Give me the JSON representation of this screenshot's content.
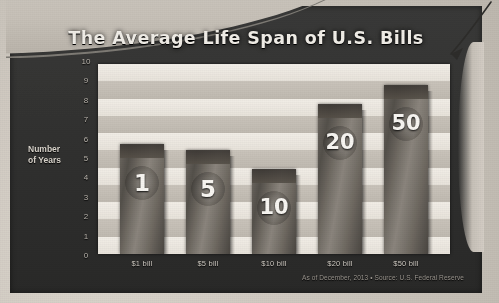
{
  "chart_data": {
    "type": "bar",
    "title": "The Average Life Span of U.S. Bills",
    "xlabel": "",
    "ylabel": "Number of Years",
    "ylim": [
      0,
      10
    ],
    "yticks": [
      "10",
      "9",
      "8",
      "7",
      "6",
      "5",
      "4",
      "3",
      "2",
      "1",
      "0"
    ],
    "grid": false,
    "legend": null,
    "categories": [
      "$1 bill",
      "$5 bill",
      "$10 bill",
      "$20 bill",
      "$50 bill"
    ],
    "values": [
      5.8,
      5.5,
      4.5,
      7.9,
      8.9
    ],
    "bar_labels": [
      "1",
      "5",
      "10",
      "20",
      "50"
    ],
    "annotation": "As of December, 2013 • Source: U.S. Federal Reserve"
  },
  "figure": {
    "title": "The Average Life Span of U.S. Bills",
    "axis_label_y_line1": "Number",
    "axis_label_y_line2": "of Years",
    "footnote": "As of December, 2013 • Source: U.S. Federal Reserve",
    "colors": {
      "panel": "#333332",
      "title_text": "#efece6",
      "plot_background": "#ded9d1",
      "bar": "#6a655e",
      "tick_text": "#b9b4ac",
      "footnote_text": "#9b968f",
      "paper": "#c9c3ba"
    }
  },
  "markup": {
    "arrow_name": "hand-drawn-arrow"
  }
}
